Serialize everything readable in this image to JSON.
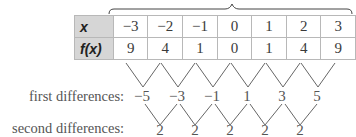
{
  "table": {
    "x_label": "x",
    "fx_label": "f(x)",
    "x_values": [
      "−3",
      "−2",
      "−1",
      "0",
      "1",
      "2",
      "3"
    ],
    "fx_values": [
      "9",
      "4",
      "1",
      "0",
      "1",
      "4",
      "9"
    ]
  },
  "first_differences": {
    "label": "first differences:",
    "values": [
      "−5",
      "−3",
      "−1",
      "1",
      "3",
      "5"
    ]
  },
  "second_differences": {
    "label": "second differences:",
    "values": [
      "2",
      "2",
      "2",
      "2",
      "2"
    ]
  },
  "colors": {
    "header_bg": "#d6d6d6",
    "border": "#b8b8b8",
    "text": "#555555"
  }
}
